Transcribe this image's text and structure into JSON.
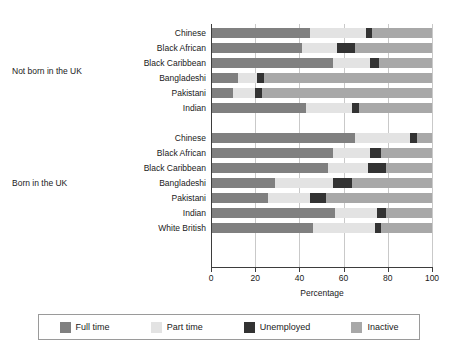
{
  "chart_data": {
    "type": "bar",
    "orientation": "horizontal",
    "stacked": true,
    "title": "",
    "xlabel": "Percentage",
    "ylabel": "",
    "xlim": [
      0,
      100
    ],
    "xticks": [
      0,
      20,
      40,
      60,
      80,
      100
    ],
    "grid": true,
    "legend_position": "bottom",
    "legend": [
      "Full time",
      "Part time",
      "Unemployed",
      "Inactive"
    ],
    "colors": {
      "full_time": "#808080",
      "part_time": "#e3e3e3",
      "unemployed": "#333333",
      "inactive": "#a8a8a8"
    },
    "group_labels": [
      "Not born in the UK",
      "Born in the UK"
    ],
    "series": [
      {
        "name": "Full time",
        "values": [
          45,
          41,
          55,
          12,
          10,
          43,
          65,
          55,
          53,
          29,
          26,
          56,
          46
        ]
      },
      {
        "name": "Part time",
        "values": [
          25,
          16,
          17,
          9,
          10,
          21,
          25,
          17,
          18,
          26,
          19,
          19,
          28
        ]
      },
      {
        "name": "Unemployed",
        "values": [
          3,
          8,
          4,
          3,
          3,
          3,
          3,
          5,
          8,
          9,
          7,
          4,
          3
        ]
      },
      {
        "name": "Inactive",
        "values": [
          27,
          35,
          24,
          76,
          77,
          33,
          7,
          23,
          21,
          36,
          48,
          21,
          23
        ]
      }
    ],
    "groups": [
      {
        "label": "Not born in the UK",
        "rows": [
          {
            "category": "Chinese",
            "full_time": 45,
            "part_time": 25,
            "unemployed": 3,
            "inactive": 27
          },
          {
            "category": "Black African",
            "full_time": 41,
            "part_time": 16,
            "unemployed": 8,
            "inactive": 35
          },
          {
            "category": "Black Caribbean",
            "full_time": 55,
            "part_time": 17,
            "unemployed": 4,
            "inactive": 24
          },
          {
            "category": "Bangladeshi",
            "full_time": 12,
            "part_time": 9,
            "unemployed": 3,
            "inactive": 76
          },
          {
            "category": "Pakistani",
            "full_time": 10,
            "part_time": 10,
            "unemployed": 3,
            "inactive": 77
          },
          {
            "category": "Indian",
            "full_time": 43,
            "part_time": 21,
            "unemployed": 3,
            "inactive": 33
          }
        ]
      },
      {
        "label": "Born in the UK",
        "rows": [
          {
            "category": "Chinese",
            "full_time": 65,
            "part_time": 25,
            "unemployed": 3,
            "inactive": 7
          },
          {
            "category": "Black African",
            "full_time": 55,
            "part_time": 17,
            "unemployed": 5,
            "inactive": 23
          },
          {
            "category": "Black Caribbean",
            "full_time": 53,
            "part_time": 18,
            "unemployed": 8,
            "inactive": 21
          },
          {
            "category": "Bangladeshi",
            "full_time": 29,
            "part_time": 26,
            "unemployed": 9,
            "inactive": 36
          },
          {
            "category": "Pakistani",
            "full_time": 26,
            "part_time": 19,
            "unemployed": 7,
            "inactive": 48
          },
          {
            "category": "Indian",
            "full_time": 56,
            "part_time": 19,
            "unemployed": 4,
            "inactive": 21
          },
          {
            "category": "White British",
            "full_time": 46,
            "part_time": 28,
            "unemployed": 3,
            "inactive": 23
          }
        ]
      }
    ]
  }
}
